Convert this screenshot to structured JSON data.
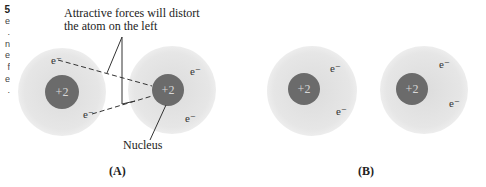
{
  "sidebar": {
    "fragment_number": "5",
    "fragment_lines": [
      "e",
      ".",
      "n",
      "e",
      "f",
      "e",
      "."
    ]
  },
  "figure": {
    "annotation_top": [
      "Attractive forces will distort",
      "the atom on the left"
    ],
    "annotation_nucleus": "Nucleus",
    "panels": [
      {
        "label": "(A)",
        "atoms": [
          {
            "nucleus_charge": "+2",
            "electrons": [
              "e⁻",
              "e⁻"
            ]
          },
          {
            "nucleus_charge": "+2",
            "electrons": [
              "e⁻",
              "e⁻"
            ]
          }
        ]
      },
      {
        "label": "(B)",
        "atoms": [
          {
            "nucleus_charge": "+2",
            "electrons": [
              "e⁻",
              "e⁻"
            ]
          },
          {
            "nucleus_charge": "+2",
            "electrons": [
              "e⁻",
              "e⁻"
            ]
          }
        ]
      }
    ],
    "colors": {
      "electron_cloud": "#e4e4e4",
      "nucleus": "#6b6b6b",
      "nucleus_text": "#d8d8d8",
      "lines": "#333333"
    }
  }
}
